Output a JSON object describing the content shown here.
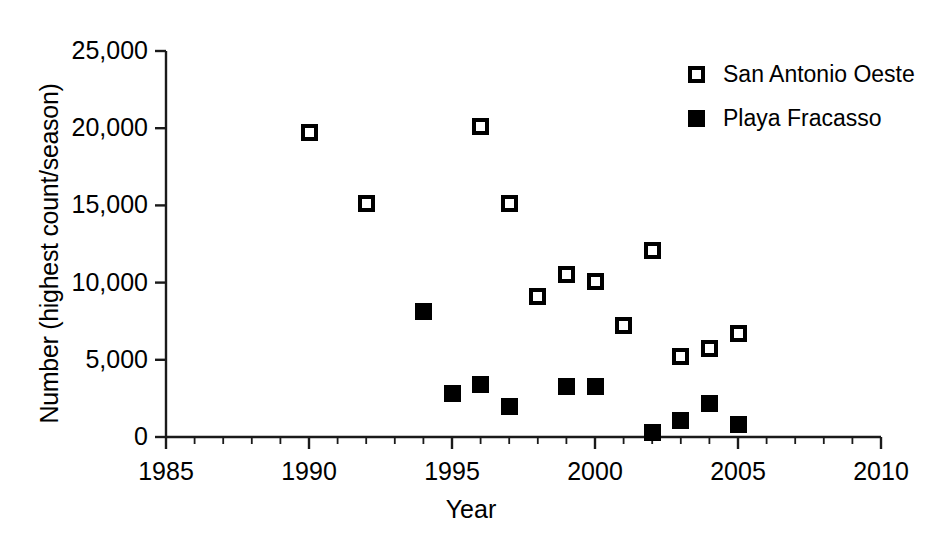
{
  "chart_data": {
    "type": "scatter",
    "title": "",
    "xlabel": "Year",
    "ylabel": "Number (highest count/season)",
    "xlim": [
      1985,
      2010
    ],
    "ylim": [
      0,
      25000
    ],
    "xticks": [
      1985,
      1990,
      1995,
      2000,
      2005,
      2010
    ],
    "xtick_labels": [
      "1985",
      "1990",
      "1995",
      "2000",
      "2005",
      "2010"
    ],
    "xminor_tick_interval": 1,
    "yticks": [
      0,
      5000,
      10000,
      15000,
      20000,
      25000
    ],
    "ytick_labels": [
      "0",
      "5,000",
      "10,000",
      "15,000",
      "20,000",
      "25,000"
    ],
    "grid": false,
    "legend_position": "top-right",
    "series": [
      {
        "name": "San Antonio Oeste",
        "marker": "open-square",
        "color": "#000000",
        "points": [
          {
            "x": 1990,
            "y": 19700
          },
          {
            "x": 1992,
            "y": 15100
          },
          {
            "x": 1996,
            "y": 20100
          },
          {
            "x": 1997,
            "y": 15100
          },
          {
            "x": 1998,
            "y": 9100
          },
          {
            "x": 1999,
            "y": 10500
          },
          {
            "x": 2000,
            "y": 10100
          },
          {
            "x": 2001,
            "y": 7200
          },
          {
            "x": 2002,
            "y": 12100
          },
          {
            "x": 2003,
            "y": 5200
          },
          {
            "x": 2004,
            "y": 5700
          },
          {
            "x": 2005,
            "y": 6700
          }
        ]
      },
      {
        "name": "Playa Fracasso",
        "marker": "filled-square",
        "color": "#000000",
        "points": [
          {
            "x": 1994,
            "y": 8100
          },
          {
            "x": 1995,
            "y": 2800
          },
          {
            "x": 1996,
            "y": 3400
          },
          {
            "x": 1997,
            "y": 2000
          },
          {
            "x": 1999,
            "y": 3300
          },
          {
            "x": 2000,
            "y": 3300
          },
          {
            "x": 2002,
            "y": 300
          },
          {
            "x": 2003,
            "y": 1100
          },
          {
            "x": 2004,
            "y": 2200
          },
          {
            "x": 2005,
            "y": 800
          }
        ]
      }
    ]
  }
}
